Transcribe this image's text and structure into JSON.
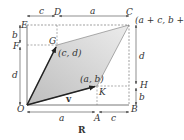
{
  "diagram": {
    "caption": "R",
    "points": {
      "O": "O",
      "A": "A",
      "B": "B",
      "C": "C",
      "D": "D",
      "E": "E",
      "F": "F",
      "G": "G",
      "H": "H",
      "K": "K"
    },
    "coordinate_labels": {
      "u_tip": "(c, d)",
      "v_tip": "(a, b)",
      "sum": "(a + c, b + d)"
    },
    "vectors": {
      "v": "v"
    },
    "dimensions": {
      "top_left": "c",
      "top_right": "a",
      "left_top": "b",
      "left_bottom": "d",
      "right_top": "d",
      "right_bottom": "b",
      "bottom_left": "a",
      "bottom_right": "c"
    },
    "colors": {
      "parallelogram_fill": "#c8c8c8",
      "lines": "#444444",
      "dashed": "#777777"
    }
  }
}
